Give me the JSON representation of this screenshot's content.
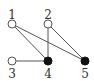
{
  "graph": {
    "nodes": [
      {
        "id": "1",
        "label": "1",
        "x": 12,
        "y": 24,
        "filled": false,
        "lx": 12,
        "ly": 19
      },
      {
        "id": "2",
        "label": "2",
        "x": 48,
        "y": 24,
        "filled": false,
        "lx": 48,
        "ly": 19
      },
      {
        "id": "3",
        "label": "3",
        "x": 12,
        "y": 61,
        "filled": false,
        "lx": 12,
        "ly": 78
      },
      {
        "id": "4",
        "label": "4",
        "x": 48,
        "y": 61,
        "filled": true,
        "lx": 48,
        "ly": 78
      },
      {
        "id": "5",
        "label": "5",
        "x": 85,
        "y": 61,
        "filled": true,
        "lx": 85,
        "ly": 78
      }
    ],
    "edges": [
      {
        "from": "1",
        "to": "4"
      },
      {
        "from": "1",
        "to": "5"
      },
      {
        "from": "2",
        "to": "4"
      },
      {
        "from": "2",
        "to": "5"
      },
      {
        "from": "3",
        "to": "4"
      }
    ],
    "colors": {
      "filled": "#111111",
      "open_fill": "#ffffff",
      "stroke": "#555555"
    }
  }
}
